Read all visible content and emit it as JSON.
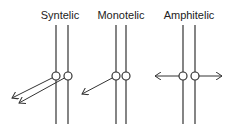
{
  "diagram": {
    "line_color": "#333333",
    "panels": [
      {
        "label": "Syntelic",
        "label_x": 60,
        "lines_x": [
          56,
          68
        ],
        "circles": [
          [
            56,
            76
          ],
          [
            68,
            76
          ]
        ],
        "arrows": [
          {
            "from": [
              56,
              76
            ],
            "to": [
              12,
              98
            ]
          },
          {
            "from": [
              68,
              76
            ],
            "to": [
              19,
              103
            ]
          }
        ]
      },
      {
        "label": "Monotelic",
        "label_x": 121,
        "lines_x": [
          116,
          126
        ],
        "circles": [
          [
            116,
            76
          ],
          [
            126,
            76
          ]
        ],
        "arrows": [
          {
            "from": [
              116,
              76
            ],
            "to": [
              82,
              94
            ]
          }
        ]
      },
      {
        "label": "Amphitelic",
        "label_x": 189,
        "lines_x": [
          183,
          195
        ],
        "circles": [
          [
            183,
            76
          ],
          [
            195,
            76
          ]
        ],
        "arrows": [
          {
            "from": [
              183,
              76
            ],
            "to": [
              155,
              76
            ]
          },
          {
            "from": [
              195,
              76
            ],
            "to": [
              222,
              76
            ]
          }
        ]
      }
    ]
  }
}
